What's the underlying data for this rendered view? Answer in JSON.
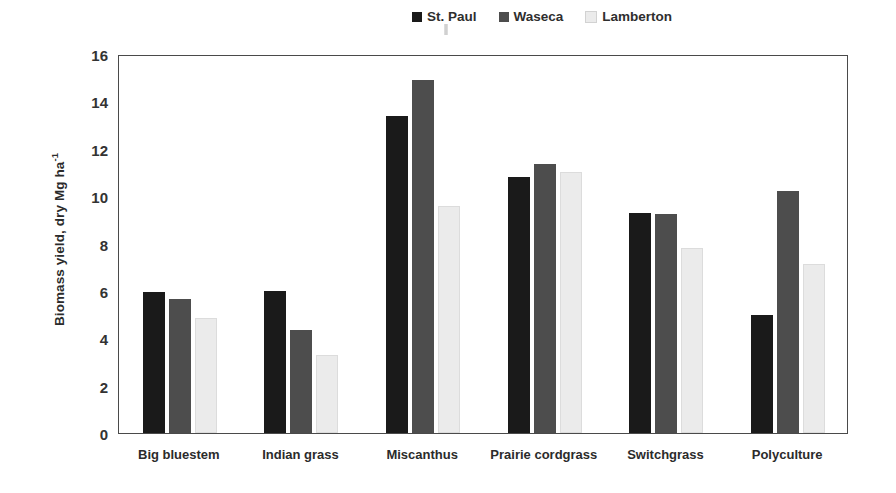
{
  "chart_data": {
    "type": "bar",
    "title": "",
    "xlabel": "",
    "ylabel": "Biomass yield, dry Mg ha",
    "ylabel_superscript": "-1",
    "ylim": [
      0,
      16
    ],
    "yticks": [
      16,
      14,
      12,
      10,
      8,
      6,
      4,
      2,
      0
    ],
    "grid": false,
    "legend_position": "top-right",
    "categories": [
      "Big bluestem",
      "Indian grass",
      "Miscanthus",
      "Prairie cordgrass",
      "Switchgrass",
      "Polyculture"
    ],
    "series": [
      {
        "name": "St. Paul",
        "color": "#1a1a1a",
        "values": [
          5.95,
          6.0,
          13.4,
          10.8,
          9.3,
          5.0
        ]
      },
      {
        "name": "Waseca",
        "color": "#4d4d4d",
        "values": [
          5.65,
          4.35,
          14.9,
          11.35,
          9.25,
          10.2
        ]
      },
      {
        "name": "Lamberton",
        "color": "#ebebeb",
        "values": [
          4.85,
          3.3,
          9.6,
          11.0,
          7.8,
          7.15
        ]
      }
    ]
  },
  "style": {
    "axis_color": "#4a4a4a",
    "text_color": "#2b2b2b",
    "background": "#ffffff"
  }
}
